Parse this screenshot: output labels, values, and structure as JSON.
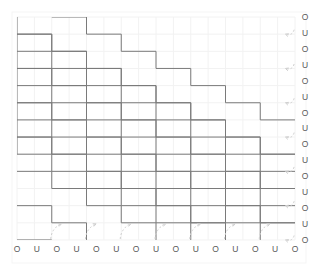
{
  "figure": {
    "title": "",
    "background_color": "#ffffff",
    "plot_area": {
      "x": 17,
      "y": 17,
      "width": 278,
      "height": 223
    },
    "colors": {
      "grid": "#f2f2f2",
      "grid_major": "#ededed",
      "path": "#7a7a7a",
      "arc": "#cfcfcf",
      "label": "#5a5a5a",
      "border": "#f5f5f5"
    }
  },
  "chart_data": {
    "type": "diagram",
    "title": "",
    "subtitle": "",
    "xlabel": "",
    "ylabel": "",
    "grid": true,
    "legend": null,
    "lattice": {
      "columns": 16,
      "rows": 13,
      "cell_width": 17.375,
      "cell_height": 17.15
    },
    "paths": {
      "count": 8,
      "shape": "staircase",
      "step_dx": 2,
      "step_dy": 1,
      "direction": "down-right",
      "line_color": "#7a7a7a",
      "line_width": 1
    },
    "arcs": {
      "bottom_count": 7,
      "right_count": 7,
      "style": "dashed",
      "arrowhead": true,
      "color": "#cfcfcf"
    },
    "bottom_labels": [
      "O",
      "U",
      "O",
      "U",
      "O",
      "U",
      "O",
      "U",
      "O",
      "U",
      "O",
      "U",
      "O",
      "U",
      "O"
    ],
    "right_labels": [
      "O",
      "U",
      "O",
      "U",
      "O",
      "U",
      "O",
      "U",
      "O",
      "U",
      "O",
      "U",
      "O",
      "U",
      "O"
    ]
  }
}
